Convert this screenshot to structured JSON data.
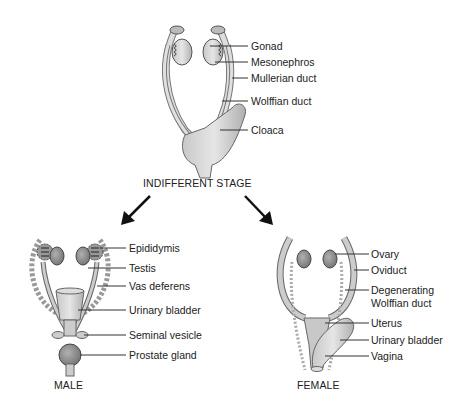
{
  "diagram": {
    "indifferent": {
      "title": "INDIFFERENT STAGE",
      "labels": [
        "Gonad",
        "Mesonephros",
        "Mullerian duct",
        "Wolffian duct",
        "Cloaca"
      ]
    },
    "male": {
      "title": "MALE",
      "labels": [
        "Epididymis",
        "Testis",
        "Vas deferens",
        "Urinary bladder",
        "Seminal vesicle",
        "Prostate gland"
      ]
    },
    "female": {
      "title": "FEMALE",
      "labels": [
        "Ovary",
        "Oviduct",
        "Degenerating",
        "Wolffian duct",
        "Uterus",
        "Urinary bladder",
        "Vagina"
      ]
    },
    "colors": {
      "tissue_light": "#d9d9d9",
      "tissue_mid": "#b8b8b8",
      "tissue_dark": "#8a8a8a",
      "outline": "#555555",
      "leader": "#333333",
      "arrow": "#111111"
    }
  }
}
